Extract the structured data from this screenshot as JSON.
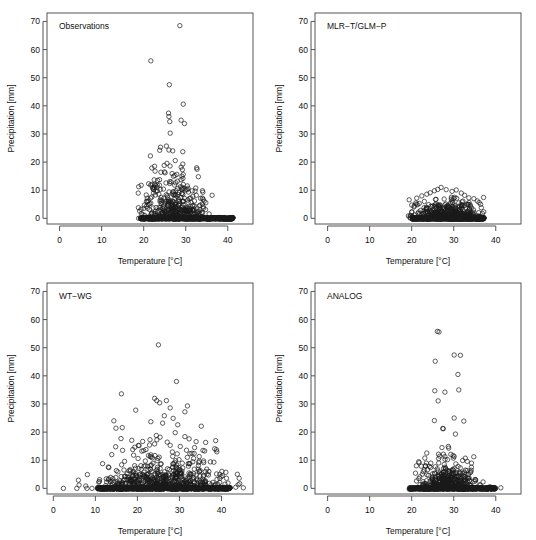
{
  "figure": {
    "background": "#ffffff",
    "point_color": "#1a1a1a",
    "axis_color": "#555555",
    "marker": "open-circle"
  },
  "chart_data": [
    {
      "type": "scatter",
      "title": "Observations",
      "xlabel": "Temperature [°C]",
      "ylabel": "Precipitation [mm]",
      "xlim": [
        -3,
        46
      ],
      "ylim": [
        -2,
        73
      ],
      "xticks": [
        0,
        10,
        20,
        30,
        40
      ],
      "yticks": [
        0,
        10,
        20,
        30,
        40,
        50,
        60,
        70
      ],
      "grid": false,
      "legend": "none",
      "x_data_range": [
        18.6,
        41.3
      ],
      "y_data_range": [
        0,
        68.5
      ],
      "n_points": 900,
      "zero_line_x_range": [
        19.3,
        41.3
      ],
      "cluster": {
        "x_center": 27.5,
        "x_spread": 3.6,
        "decay": 5.0,
        "max_y": 24
      },
      "outliers": [
        [
          28.6,
          68.5
        ],
        [
          21.7,
          56.0
        ],
        [
          26.1,
          47.5
        ],
        [
          29.4,
          40.6
        ],
        [
          25.9,
          37.4
        ],
        [
          26.0,
          36.2
        ],
        [
          26.2,
          34.4
        ],
        [
          28.9,
          34.9
        ],
        [
          29.7,
          33.7
        ],
        [
          26.3,
          30.3
        ],
        [
          24.0,
          25.3
        ],
        [
          23.8,
          24.2
        ],
        [
          25.4,
          25.7
        ],
        [
          26.0,
          24.3
        ],
        [
          26.9,
          24.0
        ],
        [
          29.3,
          23.7
        ],
        [
          21.6,
          22.2
        ],
        [
          29.3,
          19.3
        ],
        [
          28.9,
          18.2
        ],
        [
          32.6,
          18.0
        ],
        [
          29.2,
          17.3
        ],
        [
          24.1,
          16.4
        ],
        [
          29.4,
          15.6
        ],
        [
          29.1,
          15.0
        ],
        [
          33.0,
          14.8
        ],
        [
          22.5,
          13.7
        ],
        [
          23.3,
          13.5
        ],
        [
          28.0,
          13.2
        ],
        [
          25.3,
          12.6
        ],
        [
          22.6,
          12.1
        ],
        [
          22.8,
          11.7
        ],
        [
          23.2,
          11.1
        ],
        [
          29.1,
          11.1
        ],
        [
          22.1,
          10.8
        ],
        [
          24.7,
          10.4
        ],
        [
          22.4,
          10.2
        ],
        [
          22.9,
          9.6
        ],
        [
          18.7,
          9.0
        ],
        [
          28.4,
          9.2
        ],
        [
          23.6,
          8.6
        ],
        [
          27.2,
          8.2
        ],
        [
          30.9,
          7.1
        ],
        [
          21.9,
          7.6
        ],
        [
          24.3,
          6.4
        ],
        [
          25.5,
          6.0
        ],
        [
          21.4,
          5.2
        ],
        [
          30.6,
          5.6
        ],
        [
          20.9,
          3.6
        ],
        [
          32.1,
          4.4
        ],
        [
          27.6,
          4.8
        ]
      ]
    },
    {
      "type": "scatter",
      "title": "MLR−T/GLM−P",
      "xlabel": "Temperature [°C]",
      "ylabel": "Precipitation [mm]",
      "xlim": [
        -3,
        46
      ],
      "ylim": [
        -2,
        73
      ],
      "xticks": [
        0,
        10,
        20,
        30,
        40
      ],
      "yticks": [
        0,
        10,
        20,
        30,
        40,
        50,
        60,
        70
      ],
      "grid": false,
      "legend": "none",
      "x_data_range": [
        19.2,
        37.2
      ],
      "y_data_range": [
        0,
        11.0
      ],
      "n_points": 1100,
      "zero_line_x_range": [
        20.1,
        37.2
      ],
      "cluster": {
        "x_center": 29.0,
        "x_spread": 3.8,
        "decay": 1.9,
        "max_y": 11
      },
      "outliers": [
        [
          19.4,
          6.6
        ],
        [
          21.2,
          7.2
        ],
        [
          22.4,
          8.0
        ],
        [
          23.6,
          8.6
        ],
        [
          24.4,
          9.1
        ],
        [
          25.4,
          9.8
        ],
        [
          26.2,
          10.3
        ],
        [
          27.0,
          11.0
        ],
        [
          28.2,
          10.2
        ],
        [
          29.6,
          9.6
        ],
        [
          30.6,
          10.1
        ],
        [
          31.8,
          9.0
        ],
        [
          32.6,
          8.2
        ],
        [
          33.6,
          7.3
        ],
        [
          34.8,
          7.0
        ],
        [
          35.6,
          6.2
        ],
        [
          36.4,
          5.0
        ],
        [
          20.6,
          4.4
        ],
        [
          21.8,
          5.3
        ],
        [
          23.0,
          6.0
        ]
      ]
    },
    {
      "type": "scatter",
      "title": "WT−WG",
      "xlabel": "Temperature [°C]",
      "ylabel": "Precipitation [mm]",
      "xlim": [
        -1.5,
        47.5
      ],
      "ylim": [
        -2,
        73
      ],
      "xticks": [
        0,
        10,
        20,
        30,
        40
      ],
      "yticks": [
        0,
        10,
        20,
        30,
        40,
        50,
        60,
        70
      ],
      "grid": false,
      "legend": "none",
      "x_data_range": [
        2.4,
        45.2
      ],
      "y_data_range": [
        0,
        51.0
      ],
      "n_points": 1400,
      "zero_line_x_range": [
        10.4,
        42.0
      ],
      "cluster": {
        "x_center": 26.0,
        "x_spread": 7.0,
        "decay": 4.2,
        "max_y": 19
      },
      "outliers": [
        [
          25.0,
          51.0
        ],
        [
          29.3,
          38.0
        ],
        [
          16.2,
          33.6
        ],
        [
          24.1,
          32.0
        ],
        [
          24.6,
          31.2
        ],
        [
          26.9,
          31.2
        ],
        [
          25.3,
          30.4
        ],
        [
          31.9,
          29.3
        ],
        [
          27.8,
          28.6
        ],
        [
          19.6,
          27.8
        ],
        [
          31.3,
          27.2
        ],
        [
          26.4,
          25.8
        ],
        [
          28.5,
          24.9
        ],
        [
          14.4,
          24.0
        ],
        [
          23.2,
          23.7
        ],
        [
          26.0,
          23.2
        ],
        [
          29.6,
          22.6
        ],
        [
          35.2,
          22.1
        ],
        [
          14.9,
          21.4
        ],
        [
          16.4,
          21.6
        ],
        [
          29.0,
          19.8
        ],
        [
          24.5,
          18.8
        ],
        [
          25.4,
          18.2
        ],
        [
          31.3,
          18.4
        ],
        [
          16.1,
          17.7
        ],
        [
          23.0,
          17.3
        ],
        [
          32.3,
          17.6
        ],
        [
          20.4,
          15.2
        ],
        [
          22.9,
          15.4
        ],
        [
          24.1,
          15.8
        ],
        [
          27.8,
          15.3
        ],
        [
          30.2,
          14.9
        ],
        [
          33.6,
          14.5
        ],
        [
          18.9,
          13.8
        ],
        [
          21.5,
          13.4
        ],
        [
          35.6,
          13.5
        ],
        [
          36.0,
          13.3
        ],
        [
          38.9,
          13.0
        ],
        [
          13.9,
          12.0
        ],
        [
          19.1,
          11.8
        ],
        [
          33.5,
          12.4
        ],
        [
          8.1,
          4.9
        ],
        [
          13.1,
          7.6
        ],
        [
          12.6,
          3.4
        ],
        [
          10.8,
          2.2
        ],
        [
          2.4,
          0.0
        ],
        [
          5.6,
          0.0
        ],
        [
          8.0,
          0.0
        ],
        [
          9.2,
          0.0
        ],
        [
          43.4,
          0.4
        ],
        [
          45.2,
          0.2
        ],
        [
          38.2,
          9.3
        ],
        [
          39.6,
          5.0
        ],
        [
          41.2,
          3.6
        ],
        [
          37.0,
          6.0
        ]
      ]
    },
    {
      "type": "scatter",
      "title": "ANALOG",
      "xlabel": "Temperature [°C]",
      "ylabel": "Precipitation [mm]",
      "xlim": [
        -3,
        46
      ],
      "ylim": [
        -2,
        73
      ],
      "xticks": [
        0,
        10,
        20,
        30,
        40
      ],
      "yticks": [
        0,
        10,
        20,
        30,
        40,
        50,
        60,
        70
      ],
      "grid": false,
      "legend": "none",
      "x_data_range": [
        18.8,
        41.2
      ],
      "y_data_range": [
        0,
        55.8
      ],
      "n_points": 950,
      "zero_line_x_range": [
        19.4,
        40.0
      ],
      "cluster": {
        "x_center": 28.4,
        "x_spread": 3.4,
        "decay": 3.0,
        "max_y": 15
      },
      "outliers": [
        [
          26.1,
          55.8
        ],
        [
          26.5,
          55.6
        ],
        [
          30.1,
          47.4
        ],
        [
          31.6,
          47.3
        ],
        [
          25.6,
          45.2
        ],
        [
          31.0,
          40.5
        ],
        [
          31.2,
          35.0
        ],
        [
          25.5,
          34.7
        ],
        [
          27.9,
          34.2
        ],
        [
          26.3,
          31.1
        ],
        [
          30.1,
          25.0
        ],
        [
          32.4,
          23.9
        ],
        [
          25.4,
          24.1
        ],
        [
          27.4,
          21.3
        ],
        [
          27.5,
          21.2
        ],
        [
          30.4,
          19.3
        ],
        [
          28.7,
          14.9
        ],
        [
          28.8,
          14.3
        ],
        [
          27.2,
          14.5
        ],
        [
          29.3,
          12.1
        ],
        [
          27.9,
          11.3
        ],
        [
          26.4,
          10.6
        ],
        [
          33.2,
          9.6
        ],
        [
          30.5,
          8.7
        ],
        [
          21.1,
          8.0
        ],
        [
          22.3,
          7.9
        ],
        [
          23.3,
          8.0
        ],
        [
          24.2,
          7.8
        ],
        [
          34.2,
          7.5
        ],
        [
          28.0,
          7.1
        ],
        [
          29.9,
          6.4
        ],
        [
          31.4,
          5.5
        ],
        [
          23.0,
          6.6
        ],
        [
          20.9,
          5.4
        ],
        [
          35.2,
          2.7
        ],
        [
          41.2,
          0.2
        ],
        [
          38.6,
          0.6
        ],
        [
          24.0,
          4.6
        ],
        [
          25.0,
          5.2
        ],
        [
          33.5,
          5.0
        ]
      ]
    }
  ]
}
